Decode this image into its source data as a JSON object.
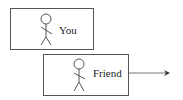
{
  "diagram": {
    "nodes": [
      {
        "id": "you",
        "label": "You",
        "icon": "stick-figure-icon"
      },
      {
        "id": "friend",
        "label": "Friend",
        "icon": "stick-figure-icon"
      }
    ],
    "edges": [
      {
        "from": "friend",
        "to": "offscreen-right",
        "type": "arrow"
      }
    ]
  }
}
